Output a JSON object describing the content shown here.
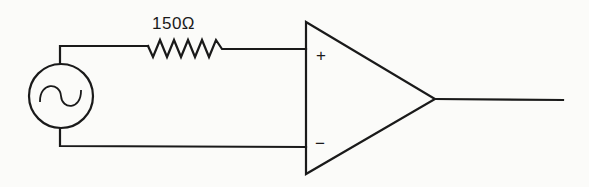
{
  "diagram": {
    "type": "circuit-schematic",
    "components": [
      {
        "id": "source",
        "kind": "ac-voltage-source",
        "symbol": "~"
      },
      {
        "id": "resistor",
        "kind": "resistor",
        "label": "150Ω"
      },
      {
        "id": "opamp",
        "kind": "operational-amplifier",
        "inputs": {
          "plus": "+",
          "minus": "−"
        }
      }
    ],
    "connections": [
      {
        "from": "source.top",
        "to": "resistor.left"
      },
      {
        "from": "resistor.right",
        "to": "opamp.plus"
      },
      {
        "from": "source.bottom",
        "to": "opamp.minus"
      },
      {
        "from": "opamp.output",
        "to": "output-line"
      }
    ]
  },
  "labels": {
    "resistor_value": "150Ω",
    "plus_input": "+",
    "minus_input": "−"
  },
  "colors": {
    "line": "#1a1a1a",
    "background": "#fbfbf9"
  }
}
